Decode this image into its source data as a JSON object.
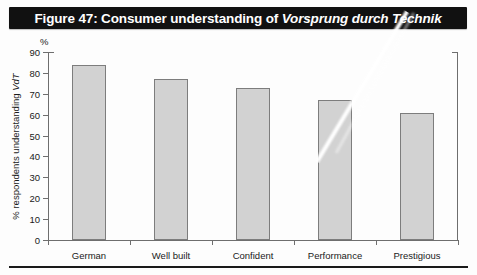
{
  "figure": {
    "title_prefix": "Figure 47: Consumer understanding of ",
    "title_italic": "Vorsprung durch Technik",
    "percent_symbol": "%"
  },
  "chart_data": {
    "type": "bar",
    "title": "Figure 47: Consumer understanding of Vorsprung durch Technik",
    "categories": [
      "German",
      "Well built",
      "Confident",
      "Performance",
      "Prestigious"
    ],
    "values": [
      84,
      77,
      73,
      67,
      61
    ],
    "xlabel": "",
    "ylabel_prefix": "% respondents understanding ",
    "ylabel_italic": "VdT",
    "ylim": [
      0,
      90
    ],
    "ytick_values": [
      0,
      10,
      20,
      30,
      40,
      50,
      60,
      70,
      80,
      90
    ],
    "ytick_labels": [
      "0",
      "10",
      "20",
      "30",
      "40",
      "50",
      "60",
      "70",
      "80",
      "90"
    ],
    "grid": false,
    "legend": null,
    "bar_fill_color": "#d2d2d2",
    "bar_border_color": "#7d7d7d",
    "axis_color": "#6e6e6e",
    "title_background": "#111111",
    "title_color": "#ffffff"
  }
}
